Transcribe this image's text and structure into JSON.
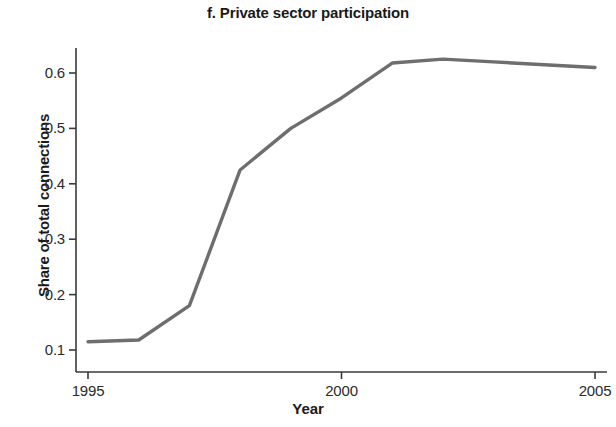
{
  "chart_data": {
    "type": "line",
    "title": "f. Private sector participation",
    "xlabel": "Year",
    "ylabel": "Share of total connections",
    "x": [
      1995,
      1996,
      1997,
      1998,
      1999,
      2000,
      2001,
      2002,
      2003,
      2004,
      2005
    ],
    "values": [
      0.115,
      0.118,
      0.18,
      0.425,
      0.5,
      0.555,
      0.618,
      0.625,
      0.62,
      0.615,
      0.61
    ],
    "series": [
      {
        "name": "Private sector participation",
        "values": [
          0.115,
          0.118,
          0.18,
          0.425,
          0.5,
          0.555,
          0.618,
          0.625,
          0.62,
          0.615,
          0.61
        ]
      }
    ],
    "xlim": [
      1995,
      2005
    ],
    "ylim": [
      0.08,
      0.645
    ],
    "x_ticks": [
      "1995",
      "2000",
      "2005"
    ],
    "x_tick_values": [
      1995,
      2000,
      2005
    ],
    "y_ticks": [
      "0.1",
      "0.2",
      "0.3",
      "0.4",
      "0.5",
      "0.6"
    ],
    "y_tick_values": [
      0.1,
      0.2,
      0.3,
      0.4,
      0.5,
      0.6
    ],
    "grid": false,
    "legend": false,
    "line_color": "#6e6e6e",
    "axis_color": "#3a3a3a",
    "background_color": "#ffffff"
  }
}
